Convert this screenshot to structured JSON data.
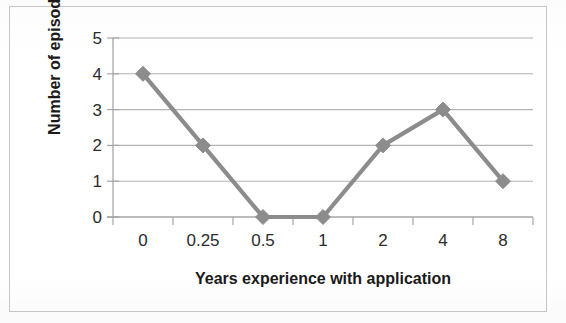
{
  "chart_data": {
    "type": "line",
    "title": "",
    "subtitle": "",
    "xlabel": "Years experience with application",
    "ylabel": "Number of episodes",
    "categories": [
      "0",
      "0.25",
      "0.5",
      "1",
      "2",
      "4",
      "8"
    ],
    "values": [
      4,
      2,
      0,
      0,
      2,
      3,
      1
    ],
    "series": [
      {
        "name": "Number of episodes",
        "values": [
          4,
          2,
          0,
          0,
          2,
          3,
          1
        ]
      }
    ],
    "ylim": [
      0,
      5
    ],
    "yticks": [
      "5",
      "4",
      "3",
      "2",
      "1",
      "0"
    ],
    "ytick_values": [
      5,
      4,
      3,
      2,
      1,
      0
    ],
    "grid": "horizontal",
    "legend": "none",
    "marker": "diamond",
    "line_color": "#8c8c8c",
    "marker_color": "#8c8c8c",
    "gridline_color": "#b3b3b3",
    "axis_color": "#a6a6a6",
    "text_color": "#1a1a1a",
    "background_color": "#ffffff",
    "border_color": "#c9c9c9"
  }
}
